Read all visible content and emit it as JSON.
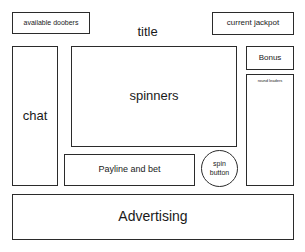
{
  "wireframe": {
    "kind": "slot-game-layout-wireframe",
    "canvas": {
      "width": 305,
      "height": 252
    },
    "colors": {
      "background": "#ffffff",
      "border": "#2b2b2b",
      "text": "#1a1a1a"
    }
  },
  "regions": {
    "available_doobers": {
      "label": "available doobers"
    },
    "current_jackpot": {
      "label": "current jackpot"
    },
    "title": {
      "label": "title"
    },
    "chat": {
      "label": "chat"
    },
    "spinners": {
      "label": "spinners"
    },
    "bonus": {
      "label": "Bonus"
    },
    "round_leaders": {
      "label": "round leaders"
    },
    "payline_and_bet": {
      "label": "Payline and bet"
    },
    "spin_button": {
      "line1": "spin",
      "line2": "button"
    },
    "advertising": {
      "label": "Advertising"
    }
  }
}
